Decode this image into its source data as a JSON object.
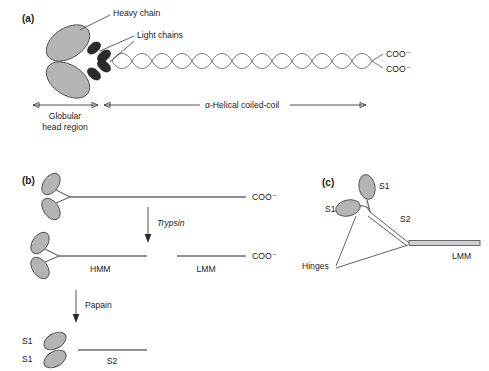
{
  "figure": {
    "background_color": "#ffffff",
    "head_fill_color": "#b4b4b4",
    "head_stroke_color": "#4f4f4f",
    "light_chain_color": "#2b2b2b",
    "rod_color": "#6b6b6b",
    "text_color": "#1a1a1a"
  },
  "panel_a": {
    "label": "(a)",
    "heavy_chain_label": "Heavy chain",
    "light_chains_label": "Light chains",
    "cooh_top": "COO⁻",
    "cooh_bottom": "COO⁻",
    "globular_label_line1": "Globular",
    "globular_label_line2": "head region",
    "coiled_coil_label": "α-Helical coiled-coil"
  },
  "panel_b": {
    "label": "(b)",
    "cooh_intact": "COO⁻",
    "trypsin_label": "Trypsin",
    "hmm_label": "HMM",
    "lmm_label": "LMM",
    "cooh_lmm": "COO⁻",
    "papain_label": "Papain",
    "s1_label_upper": "S1",
    "s1_label_lower": "S1",
    "s2_label": "S2"
  },
  "panel_c": {
    "label": "(c)",
    "s1_upper_label": "S1",
    "s1_lower_label": "S1",
    "s2_label": "S2",
    "hinges_label": "Hinges",
    "lmm_label": "LMM"
  }
}
